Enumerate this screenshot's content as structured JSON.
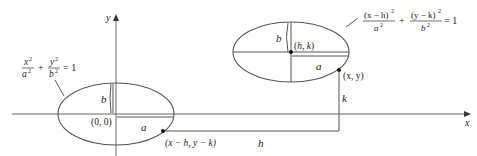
{
  "axes": {
    "x_label": "x",
    "y_label": "y"
  },
  "left_ellipse": {
    "equation_num_x": "x",
    "equation_num_y": "y",
    "equation_den_a": "a",
    "equation_den_b": "b",
    "sup": "2",
    "plus": "+",
    "equals": "= 1",
    "origin_label": "(0, 0)",
    "a_label": "a",
    "b_label": "b",
    "point_label": "(x − h, y − k)"
  },
  "right_ellipse": {
    "num_left": "(x − h)",
    "num_right": "(y − k)",
    "den_a": "a",
    "den_b": "b",
    "sup": "2",
    "plus": "+",
    "equals": "= 1",
    "center_label": "(h, k)",
    "a_label": "a",
    "b_label": "b",
    "point_label": "(x, y)"
  },
  "translation": {
    "h_label": "h",
    "k_label": "k"
  }
}
